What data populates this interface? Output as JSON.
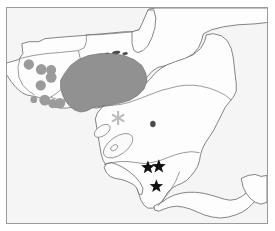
{
  "figure": {
    "kind": "distribution-map",
    "region_label": "Central America",
    "frame": {
      "border_color": "#9a9a9a",
      "background_color": "#f4f4f4"
    }
  },
  "legend_symbols": {
    "shaded_range": {
      "name": "shaded-range-polygon",
      "color": "#919191",
      "meaning_label": ""
    },
    "circle_record": {
      "name": "circle-locality-marker",
      "color": "#9b9b9b",
      "count": 9
    },
    "star_record": {
      "name": "star-locality-marker",
      "color": "#111111",
      "count": 3
    },
    "asterisk_record": {
      "name": "asterisk-locality-marker",
      "color": "#bdbdbd",
      "count": 1
    }
  },
  "map_geography": {
    "landmass_fill": "#fdfdfd",
    "coastline_color": "#6e6e6e",
    "lakes": [
      {
        "name": "lake-managua"
      },
      {
        "name": "lake-nicaragua"
      }
    ],
    "islets": [
      {
        "name": "bay-islands-islet-1"
      },
      {
        "name": "bay-islands-islet-2"
      },
      {
        "name": "bay-islands-islet-3"
      }
    ]
  },
  "markers": {
    "circles": [
      {
        "id": "c1",
        "cx": 22.0,
        "cy": 57.0,
        "r": 5.2
      },
      {
        "id": "c2",
        "cx": 34.5,
        "cy": 62.0,
        "r": 5.4
      },
      {
        "id": "c3",
        "cx": 44.5,
        "cy": 62.5,
        "r": 5.0
      },
      {
        "id": "c4",
        "cx": 44.5,
        "cy": 70.0,
        "r": 5.4
      },
      {
        "id": "c5",
        "cx": 34.0,
        "cy": 78.0,
        "r": 5.2
      },
      {
        "id": "c6",
        "cx": 38.0,
        "cy": 93.0,
        "r": 5.4
      },
      {
        "id": "c7",
        "cx": 46.0,
        "cy": 96.5,
        "r": 4.6
      },
      {
        "id": "c8",
        "cx": 53.5,
        "cy": 96.0,
        "r": 5.2
      },
      {
        "id": "c9",
        "cx": 27.0,
        "cy": 92.5,
        "r": 3.4
      }
    ],
    "stars": [
      {
        "id": "s1",
        "cx": 142.0,
        "cy": 161.0,
        "r": 7.2
      },
      {
        "id": "s2",
        "cx": 153.0,
        "cy": 160.0,
        "r": 7.4
      },
      {
        "id": "s3",
        "cx": 150.5,
        "cy": 180.0,
        "r": 7.2
      }
    ],
    "asterisks": [
      {
        "id": "a1",
        "cx": 112.0,
        "cy": 111.0,
        "r": 7.0
      }
    ]
  }
}
